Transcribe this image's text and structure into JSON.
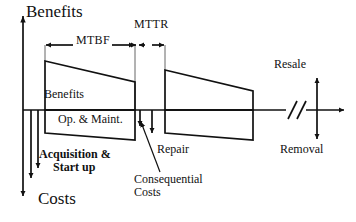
{
  "diagram": {
    "axes": {
      "vertical_up_label": "Benefits",
      "vertical_down_label": "Costs",
      "origin_x": 23,
      "baseline_y": 110
    },
    "intervals": [
      {
        "name": "mtbf",
        "label": "MTBF",
        "from_x": 45,
        "to_x": 135
      },
      {
        "name": "mttr",
        "label": "MTTR",
        "from_x": 135,
        "to_x": 165
      }
    ],
    "regions": [
      {
        "name": "benefits-block-1",
        "label": "Benefits",
        "left_x": 45,
        "right_x": 135,
        "top_left_y": 60,
        "top_right_y": 82,
        "baseline_y": 110
      },
      {
        "name": "op-maint-block-1",
        "label": "Op. & Maint.",
        "left_x": 45,
        "right_x": 135,
        "baseline_y": 110,
        "bottom_left_y": 133,
        "bottom_right_y": 140
      },
      {
        "name": "benefits-block-2",
        "label": "",
        "left_x": 165,
        "right_x": 253,
        "top_left_y": 69,
        "top_right_y": 91,
        "baseline_y": 110
      },
      {
        "name": "op-maint-block-2",
        "label": "",
        "left_x": 165,
        "right_x": 253,
        "baseline_y": 110,
        "bottom_left_y": 133,
        "bottom_right_y": 140
      }
    ],
    "annotations": [
      {
        "name": "acquisition-startup",
        "line1": "Acquisition &",
        "line2": "Start up",
        "bold": true
      },
      {
        "name": "repair",
        "label": "Repair"
      },
      {
        "name": "consequential-costs",
        "line1": "Consequential",
        "line2": "Costs"
      },
      {
        "name": "resale",
        "label": "Resale"
      },
      {
        "name": "removal",
        "label": "Removal"
      }
    ],
    "style": {
      "line_color": "#111111",
      "background": "#ffffff",
      "stroke_width": 1.6
    },
    "axis_break": {
      "name": "axis-break-marks",
      "glyph": "//",
      "x": 295
    }
  }
}
